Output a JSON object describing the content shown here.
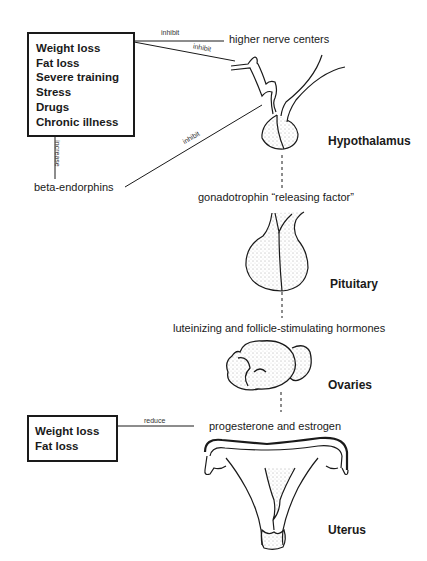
{
  "diagram": {
    "top_box": {
      "items": [
        "Weight loss",
        "Fat loss",
        "Severe training",
        "Stress",
        "Drugs",
        "Chronic illness"
      ]
    },
    "bottom_box": {
      "items": [
        "Weight loss",
        "Fat loss"
      ]
    },
    "edge_labels": {
      "inhibit_1": "inhibit",
      "inhibit_2": "inhibit",
      "inhibit_3": "inhibit",
      "increase": "increase",
      "reduce": "reduce"
    },
    "nodes": {
      "higher_nerve_centers": "higher nerve centers",
      "beta_endorphins": "beta-endorphins",
      "gonadotrophin": "gonadotrophin “releasing factor”",
      "lh_fsh": "luteinizing and follicle-stimulating hormones",
      "progesterone": "progesterone and estrogen"
    },
    "organs": {
      "hypothalamus": "Hypothalamus",
      "pituitary": "Pituitary",
      "ovaries": "Ovaries",
      "uterus": "Uterus"
    }
  }
}
